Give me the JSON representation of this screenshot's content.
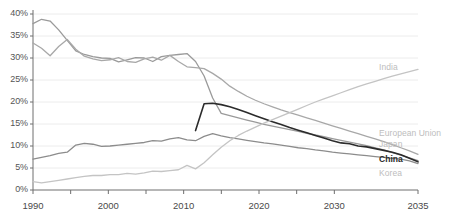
{
  "chart_data": {
    "type": "line",
    "title": "",
    "subtitle": "",
    "xlabel": "",
    "ylabel": "",
    "xlim": [
      1990,
      2035
    ],
    "ylim": [
      0,
      40
    ],
    "grid": true,
    "grid_axis": "y",
    "legend_position": "right-inline",
    "y_ticks": [
      "0%",
      "5%",
      "10%",
      "15%",
      "20%",
      "25%",
      "30%",
      "35%",
      "40%"
    ],
    "y_tick_values": [
      0,
      5,
      10,
      15,
      20,
      25,
      30,
      35,
      40
    ],
    "x_ticks": [
      "1990",
      "2000",
      "2010",
      "2020",
      "2030",
      "2035"
    ],
    "x_tick_values": [
      1990,
      2000,
      2010,
      2020,
      2030,
      2035
    ],
    "x_minor_ticks": [
      1995,
      2005,
      2015,
      2025
    ],
    "series": [
      {
        "name": "Japan",
        "color": "#9a9a9a",
        "width": 1.3,
        "x": [
          1990,
          1991,
          1992,
          1993,
          1994,
          1995,
          1996,
          1997,
          1998,
          1999,
          2000,
          2001,
          2002,
          2003,
          2004,
          2005,
          2006,
          2007,
          2008,
          2009,
          2010,
          2011,
          2012,
          2013,
          2014,
          2015,
          2016,
          2017,
          2018,
          2019,
          2020,
          2021,
          2022,
          2023,
          2024,
          2025,
          2026,
          2027,
          2028,
          2029,
          2030,
          2031,
          2032,
          2033,
          2034,
          2035
        ],
        "y": [
          37.8,
          38.8,
          38.4,
          36.4,
          34.0,
          31.6,
          30.8,
          30.3,
          30.0,
          29.9,
          29.1,
          29.6,
          30.1,
          30.0,
          29.2,
          30.3,
          30.6,
          30.8,
          31.0,
          29.2,
          25.9,
          20.9,
          17.4,
          16.9,
          16.4,
          15.9,
          15.4,
          14.9,
          14.5,
          14.1,
          13.7,
          13.3,
          12.9,
          12.5,
          12.1,
          11.7,
          11.3,
          10.9,
          10.5,
          10.1,
          9.6,
          9.1,
          8.5,
          7.9,
          7.3,
          6.7
        ]
      },
      {
        "name": "European Union",
        "color": "#a8a8a8",
        "width": 1.3,
        "x": [
          1990,
          1991,
          1992,
          1993,
          1994,
          1995,
          1996,
          1997,
          1998,
          1999,
          2000,
          2001,
          2002,
          2003,
          2004,
          2005,
          2006,
          2007,
          2008,
          2009,
          2010,
          2011,
          2012,
          2013,
          2014,
          2015,
          2016,
          2017,
          2018,
          2019,
          2020,
          2021,
          2022,
          2023,
          2024,
          2025,
          2026,
          2027,
          2028,
          2029,
          2030,
          2031,
          2032,
          2033,
          2034,
          2035
        ],
        "y": [
          33.4,
          32.2,
          30.5,
          32.6,
          34.2,
          32.0,
          30.4,
          29.8,
          29.4,
          29.6,
          30.1,
          29.2,
          29.0,
          29.8,
          30.2,
          29.5,
          30.6,
          29.2,
          28.0,
          27.8,
          27.6,
          26.5,
          25.2,
          23.6,
          22.4,
          21.3,
          20.4,
          19.6,
          18.9,
          18.2,
          17.6,
          17.0,
          16.4,
          15.8,
          15.2,
          14.6,
          14.0,
          13.4,
          12.8,
          12.2,
          11.6,
          11.0,
          10.3,
          9.6,
          8.9,
          8.1
        ]
      },
      {
        "name": "Korea",
        "color": "#8c8c8c",
        "width": 1.3,
        "x": [
          1990,
          1991,
          1992,
          1993,
          1994,
          1995,
          1996,
          1997,
          1998,
          1999,
          2000,
          2001,
          2002,
          2003,
          2004,
          2005,
          2006,
          2007,
          2008,
          2009,
          2010,
          2011,
          2012,
          2013,
          2014,
          2015,
          2016,
          2017,
          2018,
          2019,
          2020,
          2021,
          2022,
          2023,
          2024,
          2025,
          2026,
          2027,
          2028,
          2029,
          2030,
          2031,
          2032,
          2033,
          2034,
          2035
        ],
        "y": [
          7.0,
          7.4,
          7.8,
          8.3,
          8.6,
          10.2,
          10.6,
          10.4,
          9.9,
          10.0,
          10.2,
          10.4,
          10.6,
          10.8,
          11.2,
          11.1,
          11.6,
          11.9,
          11.4,
          11.2,
          12.2,
          12.8,
          12.3,
          11.9,
          11.6,
          11.3,
          11.0,
          10.7,
          10.5,
          10.2,
          9.9,
          9.6,
          9.4,
          9.1,
          8.9,
          8.6,
          8.4,
          8.2,
          8.0,
          7.8,
          7.6,
          7.4,
          7.2,
          7.0,
          6.6,
          6.0
        ]
      },
      {
        "name": "China",
        "color": "#2b2b2b",
        "width": 1.6,
        "x": [
          2009,
          2010,
          2011,
          2012,
          2013,
          2014,
          2015,
          2016,
          2017,
          2018,
          2019,
          2020,
          2021,
          2022,
          2023,
          2024,
          2025,
          2026,
          2027,
          2028,
          2029,
          2030,
          2031,
          2032,
          2033,
          2034,
          2035
        ],
        "y": [
          13.5,
          19.6,
          19.7,
          19.4,
          18.9,
          18.3,
          17.6,
          16.9,
          16.2,
          15.5,
          14.9,
          14.2,
          13.6,
          13.0,
          12.4,
          11.8,
          11.2,
          10.7,
          10.5,
          10.0,
          9.8,
          9.4,
          9.0,
          8.6,
          8.0,
          7.2,
          6.4
        ]
      },
      {
        "name": "India",
        "color": "#c4c4c4",
        "width": 1.3,
        "x": [
          1990,
          1991,
          1992,
          1993,
          1994,
          1995,
          1996,
          1997,
          1998,
          1999,
          2000,
          2001,
          2002,
          2003,
          2004,
          2005,
          2006,
          2007,
          2008,
          2009,
          2010,
          2011,
          2012,
          2013,
          2014,
          2015,
          2016,
          2017,
          2018,
          2019,
          2020,
          2021,
          2022,
          2023,
          2024,
          2025,
          2026,
          2027,
          2028,
          2029,
          2030,
          2031,
          2032,
          2033,
          2034,
          2035
        ],
        "y": [
          1.9,
          1.6,
          1.9,
          2.2,
          2.5,
          2.8,
          3.1,
          3.3,
          3.3,
          3.5,
          3.5,
          3.8,
          3.6,
          3.9,
          4.3,
          4.2,
          4.4,
          4.6,
          5.6,
          4.8,
          6.2,
          8.0,
          9.7,
          11.2,
          12.4,
          13.4,
          14.3,
          15.2,
          16.0,
          16.8,
          17.6,
          18.4,
          19.2,
          20.0,
          20.7,
          21.4,
          22.1,
          22.8,
          23.5,
          24.1,
          24.7,
          25.3,
          25.9,
          26.4,
          26.9,
          27.4
        ]
      }
    ],
    "series_labels": [
      {
        "text": "India",
        "color": "#bdbdbd",
        "bold": false
      },
      {
        "text": "European Union",
        "color": "#bdbdbd",
        "bold": false
      },
      {
        "text": "Japan",
        "color": "#bdbdbd",
        "bold": false
      },
      {
        "text": "China",
        "color": "#2b2b2b",
        "bold": true
      },
      {
        "text": "Korea",
        "color": "#bdbdbd",
        "bold": false
      }
    ],
    "colors": {
      "axis": "#6e6e6e",
      "gridline": "#ececec",
      "background": "#ffffff",
      "tick_text": "#555555"
    }
  }
}
